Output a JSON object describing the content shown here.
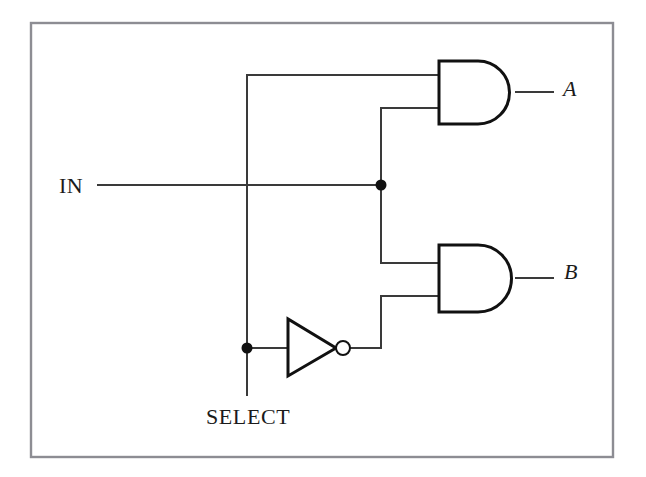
{
  "figure": {
    "kind": "logic-circuit-diagram",
    "frame": {
      "x": 31,
      "y": 23,
      "width": 582,
      "height": 434,
      "stroke_color": "#8d8d93"
    },
    "background_color": "#ffffff",
    "wire_color": "#3a3a3a",
    "gate_color": "#111111"
  },
  "labels": {
    "input_in": "IN",
    "input_select": "SELECT",
    "output_a": "A",
    "output_b": "B"
  },
  "gates": [
    {
      "id": "and-top",
      "type": "AND",
      "output_label": "A",
      "inputs": [
        "SELECT",
        "IN"
      ],
      "x": 438,
      "y": 61,
      "width": 79,
      "height": 63
    },
    {
      "id": "and-bottom",
      "type": "AND",
      "output_label": "B",
      "inputs": [
        "IN",
        "NOT SELECT"
      ],
      "x": 438,
      "y": 245,
      "width": 79,
      "height": 67
    },
    {
      "id": "inverter",
      "type": "NOT",
      "output_label": "NOT SELECT",
      "inputs": [
        "SELECT"
      ],
      "x": 287,
      "y": 319,
      "width": 48,
      "height": 56
    }
  ],
  "junctions": [
    {
      "id": "in-junction",
      "net": "IN",
      "x": 381,
      "y": 185,
      "radius": 5
    },
    {
      "id": "select-junction",
      "net": "SELECT",
      "x": 247,
      "y": 348,
      "radius": 5
    }
  ],
  "nets": [
    {
      "id": "net-in",
      "name": "IN",
      "from": "IN terminal",
      "to": [
        "and-top input 2",
        "and-bottom input 1"
      ]
    },
    {
      "id": "net-select",
      "name": "SELECT",
      "from": "SELECT terminal",
      "to": [
        "and-top input 1",
        "inverter input"
      ]
    },
    {
      "id": "net-nselect",
      "name": "NOT SELECT",
      "from": "inverter output",
      "to": [
        "and-bottom input 2"
      ]
    },
    {
      "id": "net-a",
      "name": "A",
      "from": "and-top output",
      "to": [
        "A terminal"
      ]
    },
    {
      "id": "net-b",
      "name": "B",
      "from": "and-bottom output",
      "to": [
        "B terminal"
      ]
    }
  ]
}
